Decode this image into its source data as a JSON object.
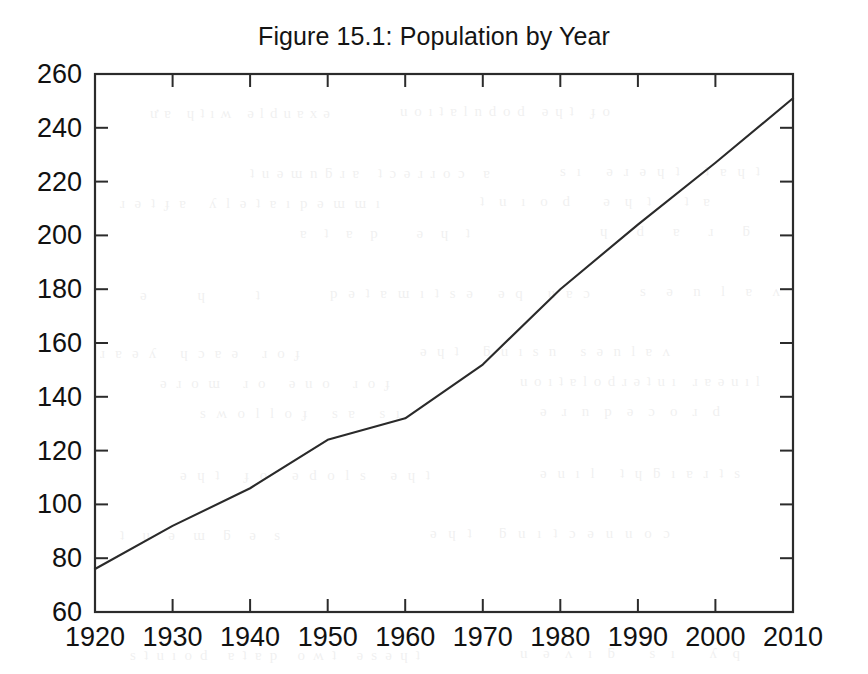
{
  "figure": {
    "title": "Figure 15.1: Population by Year",
    "axis_color": "#2b2b2b",
    "line_color": "#2a2a2a",
    "background": "#ffffff"
  },
  "chart_data": {
    "type": "line",
    "title": "Figure 15.1: Population by Year",
    "xlabel": "",
    "ylabel": "",
    "x": [
      1920,
      1930,
      1940,
      1950,
      1960,
      1970,
      1980,
      1990,
      2000,
      2010
    ],
    "values": [
      76,
      92,
      106,
      124,
      132,
      152,
      180,
      204,
      227,
      251
    ],
    "series": [
      {
        "name": "Population",
        "values": [
          76,
          92,
          106,
          124,
          132,
          152,
          180,
          204,
          227,
          251
        ]
      }
    ],
    "xlim": [
      1920,
      2010
    ],
    "ylim": [
      60,
      260
    ],
    "xticks": [
      1920,
      1930,
      1940,
      1950,
      1960,
      1970,
      1980,
      1990,
      2000,
      2010
    ],
    "yticks": [
      60,
      80,
      100,
      120,
      140,
      160,
      180,
      200,
      220,
      240,
      260
    ],
    "xtick_labels": [
      "1920",
      "1930",
      "1940",
      "1950",
      "1960",
      "1970",
      "1980",
      "1990",
      "2000",
      "2010"
    ],
    "ytick_labels": [
      "60",
      "80",
      "100",
      "120",
      "140",
      "160",
      "180",
      "200",
      "220",
      "240",
      "260"
    ],
    "grid": false,
    "legend": null,
    "tick_direction": "in",
    "annotations": []
  }
}
